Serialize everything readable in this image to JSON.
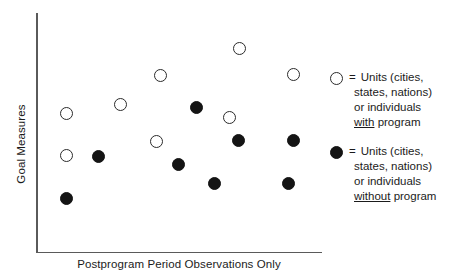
{
  "chart_data": {
    "type": "scatter",
    "title": "",
    "xlabel": "Postprogram Period Observations Only",
    "ylabel": "Goal Measures",
    "grid": false,
    "axis_ticks": false,
    "xlim": [
      0,
      1
    ],
    "ylim": [
      0,
      1
    ],
    "legend_position": "right",
    "series": [
      {
        "name": "Units (cities, states, nations) or individuals with program",
        "marker": "open-circle",
        "color": "#ffffff",
        "edge_color": "#2b2b2b",
        "points": [
          {
            "x": 0.105,
            "y": 0.578
          },
          {
            "x": 0.105,
            "y": 0.402
          },
          {
            "x": 0.294,
            "y": 0.617
          },
          {
            "x": 0.434,
            "y": 0.739
          },
          {
            "x": 0.71,
            "y": 0.852
          },
          {
            "x": 0.42,
            "y": 0.463
          },
          {
            "x": 0.675,
            "y": 0.563
          },
          {
            "x": 0.899,
            "y": 0.743
          }
        ]
      },
      {
        "name": "Units (cities, states, nations) or individuals without program",
        "marker": "filled-circle",
        "color": "#141414",
        "edge_color": "#141414",
        "points": [
          {
            "x": 0.105,
            "y": 0.223
          },
          {
            "x": 0.217,
            "y": 0.398
          },
          {
            "x": 0.56,
            "y": 0.602
          },
          {
            "x": 0.497,
            "y": 0.363
          },
          {
            "x": 0.707,
            "y": 0.463
          },
          {
            "x": 0.899,
            "y": 0.463
          },
          {
            "x": 0.622,
            "y": 0.285
          },
          {
            "x": 0.881,
            "y": 0.285
          }
        ]
      }
    ],
    "points_pixels": {
      "open": [
        {
          "cx": 66,
          "cy": 113
        },
        {
          "cx": 66,
          "cy": 155
        },
        {
          "cx": 120,
          "cy": 104
        },
        {
          "cx": 160,
          "cy": 75
        },
        {
          "cx": 239,
          "cy": 48
        },
        {
          "cx": 156,
          "cy": 141
        },
        {
          "cx": 229,
          "cy": 117
        },
        {
          "cx": 293,
          "cy": 74
        }
      ],
      "filled": [
        {
          "cx": 66,
          "cy": 198
        },
        {
          "cx": 98,
          "cy": 156
        },
        {
          "cx": 196,
          "cy": 107
        },
        {
          "cx": 178,
          "cy": 164
        },
        {
          "cx": 238,
          "cy": 140
        },
        {
          "cx": 293,
          "cy": 140
        },
        {
          "cx": 214,
          "cy": 183
        },
        {
          "cx": 288,
          "cy": 183
        }
      ]
    }
  },
  "axes": {
    "y_label": "Goal Measures",
    "x_label": "Postprogram Period Observations Only"
  },
  "legend": {
    "entries": [
      {
        "marker": "open-circle",
        "equals": "=",
        "line1": "Units (cities,",
        "line2": "states, nations)",
        "line3": "or individuals",
        "line4_underlined": "with",
        "line4_rest": " program"
      },
      {
        "marker": "filled-circle",
        "equals": "=",
        "line1": "Units (cities,",
        "line2": "states, nations)",
        "line3": "or individuals",
        "line4_underlined": "without",
        "line4_rest": " program"
      }
    ]
  },
  "colors": {
    "axis": "#5a5a5a",
    "text": "#1b1b1b",
    "marker_fill": "#141414",
    "marker_open": "#ffffff",
    "background": "#ffffff"
  }
}
